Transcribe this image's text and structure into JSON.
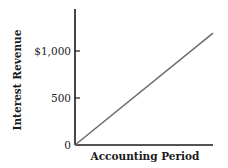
{
  "chart_data": {
    "type": "line",
    "title": "",
    "xlabel": "Accounting Period",
    "ylabel": "Interest Revenue",
    "ylim": [
      0,
      1400
    ],
    "xlim": [
      0,
      1
    ],
    "y_ticks": [
      {
        "value": 0,
        "label": "0"
      },
      {
        "value": 500,
        "label": "500"
      },
      {
        "value": 1000,
        "label": "$1,000"
      }
    ],
    "x_ticks": [],
    "grid": false,
    "legend": "none",
    "series": [
      {
        "name": "Interest Revenue",
        "color": "#6e6e6e",
        "points": [
          {
            "x": 0,
            "y": 0
          },
          {
            "x": 1,
            "y": 1190
          }
        ]
      }
    ]
  },
  "colors": {
    "axis": "#1a1a1a",
    "line": "#6e6e6e"
  }
}
